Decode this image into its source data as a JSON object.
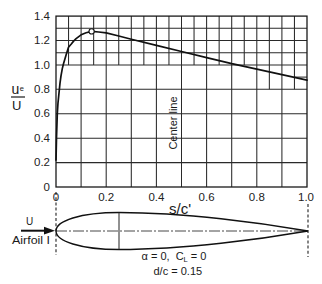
{
  "figure": {
    "y_label": {
      "numerator": "u",
      "subscript": "e",
      "denominator": "U"
    },
    "x_label": "s/c'",
    "center_line_label": "Center line",
    "flow_label": "U",
    "airfoil_label": "Airfoil I",
    "conditions": {
      "alpha": "α = 0,",
      "cl_symbol": "C",
      "cl_subscript": "L",
      "cl_value": " = 0",
      "thickness": "d/c = 0.15"
    },
    "colors": {
      "line": "#111111",
      "grid": "#2a2a2a",
      "background": "#ffffff"
    }
  },
  "chart_data": {
    "type": "line",
    "title": "",
    "xlabel": "s/c'",
    "ylabel": "u_e/U",
    "xlim": [
      0,
      1.0
    ],
    "ylim": [
      0,
      1.4
    ],
    "xticks": [
      "0",
      "0.2",
      "0.4",
      "0.6",
      "0.8",
      "1.0"
    ],
    "yticks": [
      "0",
      "0.2",
      "0.4",
      "0.6",
      "0.8",
      "1.0",
      "1.2",
      "1.4"
    ],
    "grid": true,
    "legend": null,
    "series": [
      {
        "name": "u_e/U",
        "x": [
          0,
          0.002,
          0.005,
          0.008,
          0.012,
          0.016,
          0.02,
          0.025,
          0.03,
          0.04,
          0.05,
          0.06,
          0.07,
          0.08,
          0.1,
          0.12,
          0.142,
          0.17,
          0.2,
          0.25,
          0.3,
          0.4,
          0.5,
          0.6,
          0.7,
          0.8,
          0.9,
          1.0
        ],
        "y": [
          0.22,
          0.4,
          0.6,
          0.69,
          0.77,
          0.85,
          0.91,
          0.97,
          1.01,
          1.08,
          1.145,
          1.17,
          1.195,
          1.215,
          1.247,
          1.263,
          1.275,
          1.27,
          1.262,
          1.237,
          1.21,
          1.16,
          1.11,
          1.06,
          1.01,
          0.965,
          0.92,
          0.875
        ]
      }
    ],
    "markers": [
      {
        "shape": "open-circle",
        "x": 0.142,
        "y": 1.275
      }
    ],
    "annotations": [
      {
        "text": "Center line",
        "x": 0.47,
        "y": 0.52,
        "rotation": -90
      },
      {
        "text": "Airfoil I",
        "position": "below-axis-left"
      },
      {
        "text": "α = 0, C_L = 0",
        "position": "below-airfoil"
      },
      {
        "text": "d/c = 0.15",
        "position": "below-airfoil"
      }
    ],
    "airfoil": {
      "alpha": 0,
      "CL": 0,
      "d_over_c": 0.15
    }
  }
}
